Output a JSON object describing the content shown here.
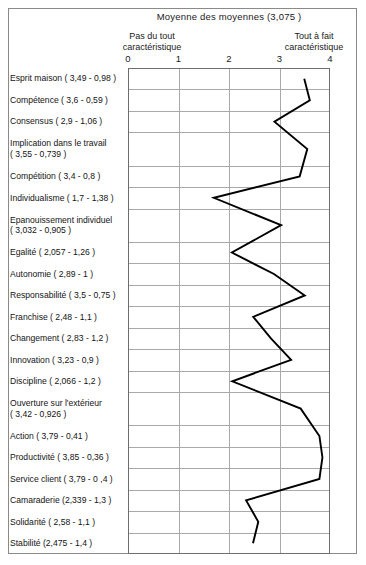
{
  "chart_data": {
    "type": "line",
    "orientation": "horizontal",
    "title": "Moyenne des  moyennes  (3,075 )",
    "xlabel": "",
    "ylabel": "",
    "xlim": [
      0,
      4
    ],
    "xticks": [
      "0",
      "1",
      "2",
      "3",
      "4"
    ],
    "grid": true,
    "legend": null,
    "axis_anchors": {
      "low": "Pas du tout\ncaractéristique",
      "low_line1": "Pas du tout",
      "low_line2": "caractéristique",
      "high_line1": "Tout à fait",
      "high_line2": "caractéristique"
    },
    "overall_mean": 3.075,
    "categories": [
      "Esprit maison ( 3,49 - 0,98 )",
      "Compétence  ( 3,6 - 0,59 )",
      "Consensus ( 2,9 - 1,06 )",
      "Implication dans le travail\n( 3,55 - 0,739 )",
      "Compétition ( 3,4 - 0,8 )",
      "Individualisme ( 1,7 - 1,38 )",
      "Epanouissement individuel\n( 3,032 - 0,905 )",
      "Egalité ( 2,057 - 1,26 )",
      "Autonomie ( 2,89 - 1 )",
      "Responsabilité ( 3,5 - 0,75 )",
      "Franchise ( 2,48 - 1,1 )",
      "Changement ( 2,83 - 1,2 )",
      "Innovation ( 3,23 - 0,9 )",
      "Discipline ( 2,066 - 1,2 )",
      "Ouverture sur l'extérieur\n( 3,42 - 0,926 )",
      "Action ( 3,79 - 0,41 )",
      "Productivité ( 3,85 - 0,36 )",
      "Service client ( 3,79 - 0 ,4 )",
      "Camaraderie (2,339 - 1,3 )",
      "Solidarité ( 2,58 - 1,1 )",
      "Stabilité (2,475 - 1,4 )"
    ],
    "category_names": [
      "Esprit maison",
      "Compétence",
      "Consensus",
      "Implication dans le travail",
      "Compétition",
      "Individualisme",
      "Epanouissement individuel",
      "Egalité",
      "Autonomie",
      "Responsabilité",
      "Franchise",
      "Changement",
      "Innovation",
      "Discipline",
      "Ouverture sur l'extérieur",
      "Action",
      "Productivité",
      "Service client",
      "Camaraderie",
      "Solidarité",
      "Stabilité"
    ],
    "values": [
      3.49,
      3.6,
      2.9,
      3.55,
      3.4,
      1.7,
      3.032,
      2.057,
      2.89,
      3.5,
      2.48,
      2.83,
      3.23,
      2.066,
      3.42,
      3.79,
      3.85,
      3.79,
      2.339,
      2.58,
      2.475
    ],
    "std_devs": [
      0.98,
      0.59,
      1.06,
      0.739,
      0.8,
      1.38,
      0.905,
      1.26,
      1.0,
      0.75,
      1.1,
      1.2,
      0.9,
      1.2,
      0.926,
      0.41,
      0.36,
      0.4,
      1.3,
      1.1,
      1.4
    ],
    "line_color": "#000000"
  }
}
